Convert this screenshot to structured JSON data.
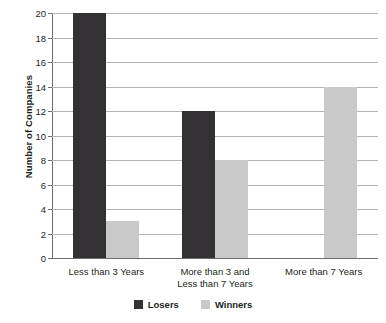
{
  "chart_data": {
    "type": "bar",
    "title": "",
    "xlabel": "",
    "ylabel": "Number of Companies",
    "categories": [
      "Less than 3 Years",
      "More than 3 and\nLess than 7 Years",
      "More than 7 Years"
    ],
    "series": [
      {
        "name": "Losers",
        "color": "#333133",
        "values": [
          20,
          12,
          null
        ]
      },
      {
        "name": "Winners",
        "color": "#c9c9c9",
        "values": [
          3,
          8,
          14
        ]
      }
    ],
    "ylim": [
      0,
      20
    ],
    "ytick_step": 2,
    "yticks": [
      20,
      18,
      16,
      14,
      12,
      10,
      8,
      6,
      4,
      2,
      0
    ],
    "grid": "horizontal",
    "legend_position": "bottom"
  },
  "legend": {
    "items": [
      {
        "label": "Losers",
        "swatch": "losers-swatch"
      },
      {
        "label": "Winners",
        "swatch": "winners-swatch"
      }
    ]
  }
}
